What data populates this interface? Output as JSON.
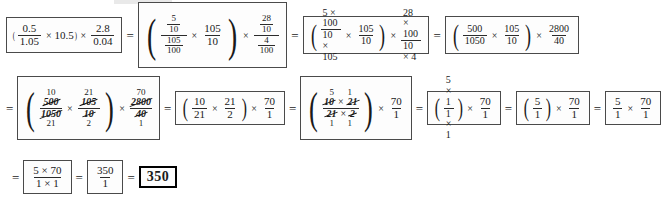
{
  "document": {
    "title": "Stepwise arithmetic simplification worksheet",
    "final_answer": "350",
    "equals": "=",
    "times": "×",
    "paren_open": "(",
    "paren_close": ")"
  },
  "row1": {
    "step1": {
      "label": "original expression",
      "a_num": "0.5",
      "a_den": "1.05",
      "factor": "10.5",
      "b_num": "2.8",
      "b_den": "0.04"
    },
    "step2": {
      "label": "decimals as complex fractions",
      "a_top_num": "5",
      "a_top_den": "10",
      "a_bot_num": "105",
      "a_bot_den": "100",
      "c_num": "105",
      "c_den": "10",
      "b_top_num": "28",
      "b_top_den": "10",
      "b_bot_num": "4",
      "b_bot_den": "100"
    },
    "step3": {
      "label": "cross multiplied",
      "a_num": "5 × 100",
      "a_den": "10 × 105",
      "c_num": "105",
      "c_den": "10",
      "b_num": "28 × 100",
      "b_den": "10 × 4"
    },
    "step4": {
      "label": "products evaluated",
      "a_num": "500",
      "a_den": "1050",
      "c_num": "105",
      "c_den": "10",
      "b_num": "2800",
      "b_den": "40"
    }
  },
  "row2": {
    "step5": {
      "label": "first cancellation",
      "a_num_small": "10",
      "a_num_struck": "500",
      "a_den_struck": "1050",
      "a_den_small": "21",
      "c_num_small": "21",
      "c_num_struck": "105",
      "c_den_struck": "10",
      "c_den_small": "2",
      "b_num_small": "70",
      "b_num_struck": "2800",
      "b_den_struck": "40",
      "b_den_small": "1"
    },
    "step6": {
      "label": "reduced fractions",
      "a_num": "10",
      "a_den": "21",
      "c_num": "21",
      "c_den": "2",
      "b_num": "70",
      "b_den": "1"
    },
    "step7": {
      "label": "second cancellation",
      "num_small_left": "5",
      "num_small_right": "1",
      "num_struck_left": "10",
      "num_struck_right": "21",
      "den_struck_left": "21",
      "den_struck_right": "2",
      "den_small_left": "1",
      "den_small_right": "1",
      "b_num": "70",
      "b_den": "1"
    },
    "step8": {
      "label": "after cancelling",
      "a_num": "5 × 1",
      "a_den": "1 × 1",
      "b_num": "70",
      "b_den": "1"
    },
    "step9": {
      "label": "simplified parenthesis",
      "a_num": "5",
      "a_den": "1",
      "b_num": "70",
      "b_den": "1"
    },
    "step10": {
      "label": "parenthesis removed",
      "a_num": "5",
      "a_den": "1",
      "b_num": "70",
      "b_den": "1"
    }
  },
  "row3": {
    "step11": {
      "label": "multiplied out",
      "num": "5 × 70",
      "den": "1 × 1"
    },
    "step12": {
      "label": "product",
      "num": "350",
      "den": "1"
    },
    "step13": {
      "label": "final answer",
      "value": "350"
    }
  }
}
